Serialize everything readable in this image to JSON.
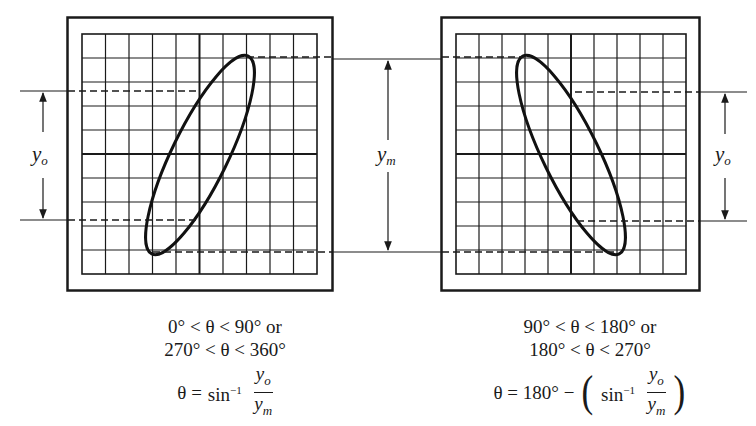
{
  "figure": {
    "cropped_caption_fragment": "g",
    "stroke_color": "#1a1a1a",
    "background": "#ffffff",
    "grid": {
      "columns": 10,
      "rows": 10
    },
    "panels": [
      {
        "id": "left",
        "description": "Lissajous ellipse tilted right (positive slope)",
        "labels": {
          "inner_span": "y",
          "inner_span_sub": "o"
        },
        "caption": {
          "line1": "0° < θ < 90° or",
          "line2": "270° < θ < 360°",
          "formula_lhs": "θ =",
          "formula_fn": "sin",
          "formula_exp": "−1",
          "frac_num": "y",
          "frac_num_sub": "o",
          "frac_den": "y",
          "frac_den_sub": "m"
        }
      },
      {
        "id": "right",
        "description": "Lissajous ellipse tilted left (negative slope)",
        "labels": {
          "inner_span": "y",
          "inner_span_sub": "o"
        },
        "caption": {
          "line1": "90° < θ < 180° or",
          "line2": "180° < θ < 270°",
          "formula_lhs": "θ = 180° −",
          "formula_fn": "sin",
          "formula_exp": "−1",
          "frac_num": "y",
          "frac_num_sub": "o",
          "frac_den": "y",
          "frac_den_sub": "m",
          "paren_open": "(",
          "paren_close": ")"
        }
      }
    ],
    "center_label": {
      "text": "y",
      "sub": "m"
    }
  }
}
